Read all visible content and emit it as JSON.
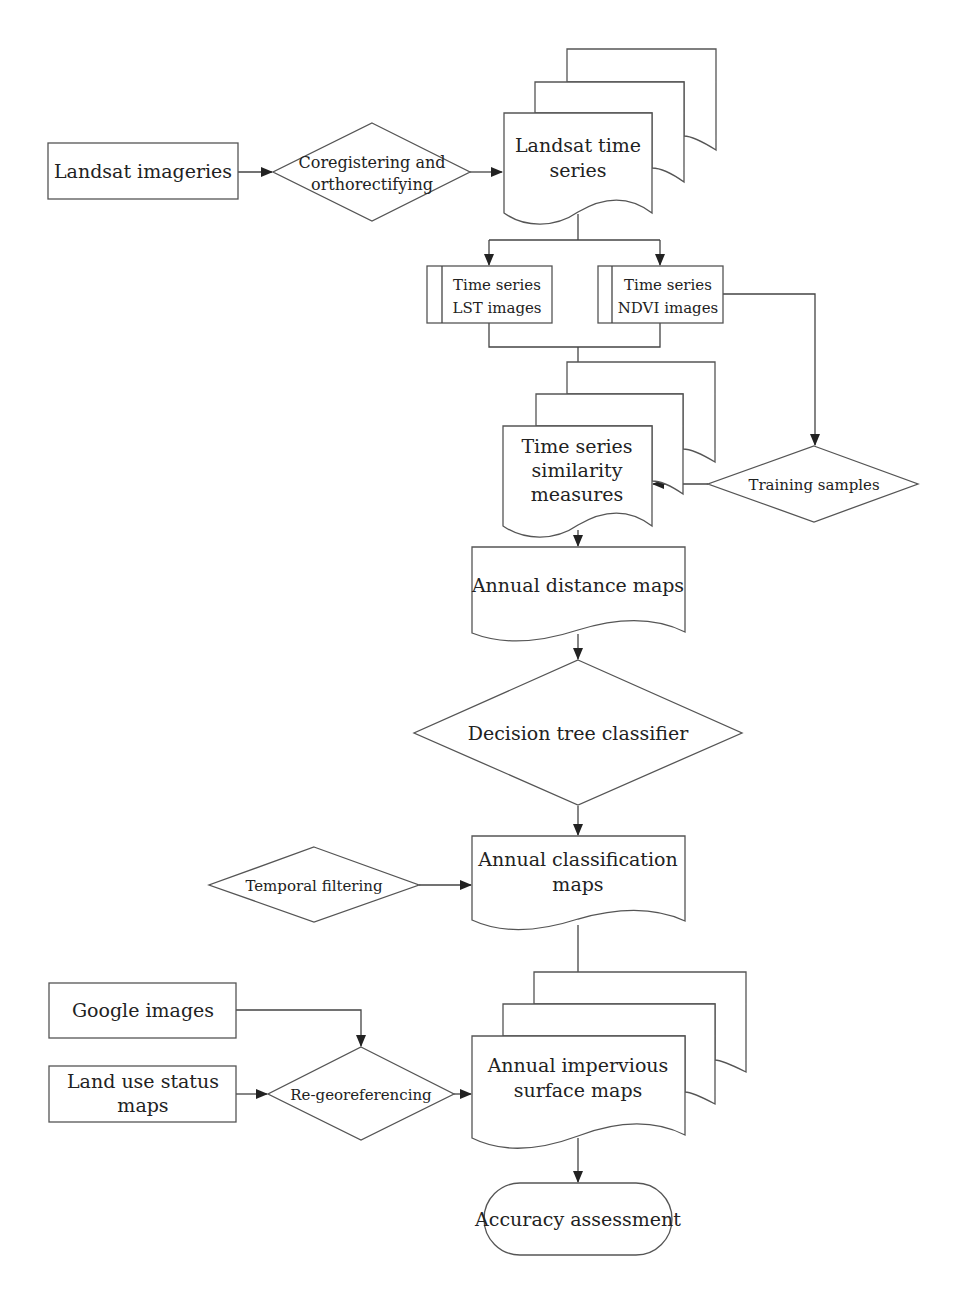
{
  "diagram": {
    "type": "flowchart",
    "nodes": {
      "landsat_imageries": {
        "shape": "process",
        "lines": [
          "Landsat imageries"
        ]
      },
      "coregistering": {
        "shape": "decision",
        "lines": [
          "Coregistering and",
          "orthorectifying"
        ]
      },
      "landsat_time_series": {
        "shape": "multi-document",
        "lines": [
          "Landsat time",
          "series"
        ]
      },
      "lst_images": {
        "shape": "predefined-process",
        "lines": [
          "Time series",
          "LST images"
        ]
      },
      "ndvi_images": {
        "shape": "predefined-process",
        "lines": [
          "Time series",
          "NDVI images"
        ]
      },
      "similarity_measures": {
        "shape": "multi-document",
        "lines": [
          "Time series",
          "similarity",
          "measures"
        ]
      },
      "training_samples": {
        "shape": "decision",
        "lines": [
          "Training samples"
        ]
      },
      "annual_distance_maps": {
        "shape": "document",
        "lines": [
          "Annual distance maps"
        ]
      },
      "decision_tree": {
        "shape": "decision",
        "lines": [
          "Decision tree classifier"
        ]
      },
      "temporal_filtering": {
        "shape": "decision",
        "lines": [
          "Temporal filtering"
        ]
      },
      "annual_classification_maps": {
        "shape": "document",
        "lines": [
          "Annual classification",
          "maps"
        ]
      },
      "google_images": {
        "shape": "process",
        "lines": [
          "Google images"
        ]
      },
      "land_use_status_maps": {
        "shape": "process",
        "lines": [
          "Land use status",
          "maps"
        ]
      },
      "re_georeferencing": {
        "shape": "decision",
        "lines": [
          "Re-georeferencing"
        ]
      },
      "impervious_surface_maps": {
        "shape": "multi-document",
        "lines": [
          "Annual impervious",
          "surface maps"
        ]
      },
      "accuracy_assessment": {
        "shape": "terminator",
        "lines": [
          "Accuracy assessment"
        ]
      }
    },
    "edges": [
      [
        "landsat_imageries",
        "coregistering"
      ],
      [
        "coregistering",
        "landsat_time_series"
      ],
      [
        "landsat_time_series",
        "lst_images"
      ],
      [
        "landsat_time_series",
        "ndvi_images"
      ],
      [
        "lst_images",
        "similarity_measures"
      ],
      [
        "ndvi_images",
        "similarity_measures"
      ],
      [
        "ndvi_images",
        "training_samples"
      ],
      [
        "training_samples",
        "similarity_measures"
      ],
      [
        "similarity_measures",
        "annual_distance_maps"
      ],
      [
        "annual_distance_maps",
        "decision_tree"
      ],
      [
        "decision_tree",
        "annual_classification_maps"
      ],
      [
        "temporal_filtering",
        "annual_classification_maps"
      ],
      [
        "annual_classification_maps",
        "impervious_surface_maps"
      ],
      [
        "google_images",
        "re_georeferencing"
      ],
      [
        "land_use_status_maps",
        "re_georeferencing"
      ],
      [
        "re_georeferencing",
        "impervious_surface_maps"
      ],
      [
        "impervious_surface_maps",
        "accuracy_assessment"
      ]
    ],
    "colors": {
      "stroke": "#555555",
      "text": "#222222",
      "background": "#ffffff"
    }
  }
}
